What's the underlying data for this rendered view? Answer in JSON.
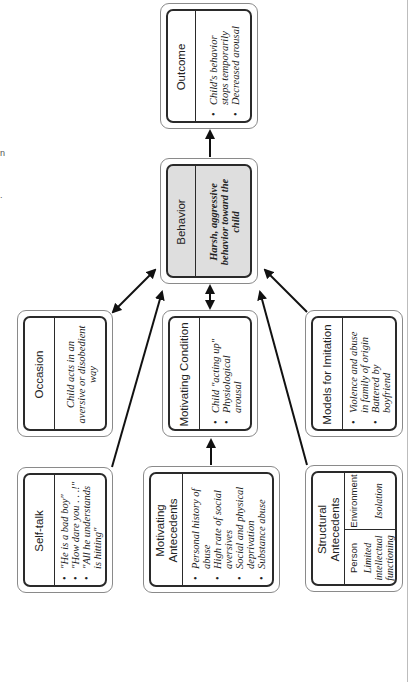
{
  "diagram": {
    "orientation": "rotated 90 degrees counter-clockwise",
    "colors": {
      "box_border": "#2a2a2a",
      "outer_border": "#8a8a8a",
      "behavior_fill": "#dedede",
      "arrow": "#111111"
    },
    "nodes": {
      "outcome": {
        "title": "Outcome",
        "items": [
          "Child's behavior stops temporarily",
          "Decreased arousal"
        ]
      },
      "behavior": {
        "title": "Behavior",
        "text": "Harsh, aggressive behavior toward the child"
      },
      "occasion": {
        "title": "Occasion",
        "text": "Child acts in an aversive or disobedient way"
      },
      "motivating_condition": {
        "title": "Motivating Condition",
        "items": [
          "Child \"acting up\"",
          "Physiological arousal"
        ]
      },
      "models_for_imitation": {
        "title": "Models for Imitation",
        "items": [
          "Violence and abuse in family of origin",
          "Battered by boyfriend"
        ]
      },
      "self_talk": {
        "title": "Self-talk",
        "items": [
          "\"He is a bad boy\"",
          "\"How dare you . . .!\"",
          "\"All he understands is hitting\""
        ]
      },
      "motivating_antecedents": {
        "title": "Motivating Antecedents",
        "items": [
          "Personal history of abuse",
          "High rate of social aversives",
          "Social and physical deprivation",
          "Substance abuse"
        ]
      },
      "structural_antecedents": {
        "title": "Structural Antecedents",
        "columns": [
          {
            "label": "Person",
            "value": "Limited intellectual functioning"
          },
          {
            "label": "Environment",
            "value": "Isolation"
          }
        ]
      }
    },
    "edges": [
      {
        "from": "behavior",
        "to": "outcome",
        "type": "arrow"
      },
      {
        "from": "occasion",
        "to": "behavior",
        "type": "double-arrow"
      },
      {
        "from": "motivating_condition",
        "to": "behavior",
        "type": "double-arrow"
      },
      {
        "from": "models_for_imitation",
        "to": "behavior",
        "type": "arrow"
      },
      {
        "from": "self_talk",
        "to": "behavior",
        "type": "arrow"
      },
      {
        "from": "structural_antecedents",
        "to": "behavior",
        "type": "arrow"
      },
      {
        "from": "motivating_antecedents",
        "to": "motivating_condition",
        "type": "arrow"
      }
    ]
  }
}
